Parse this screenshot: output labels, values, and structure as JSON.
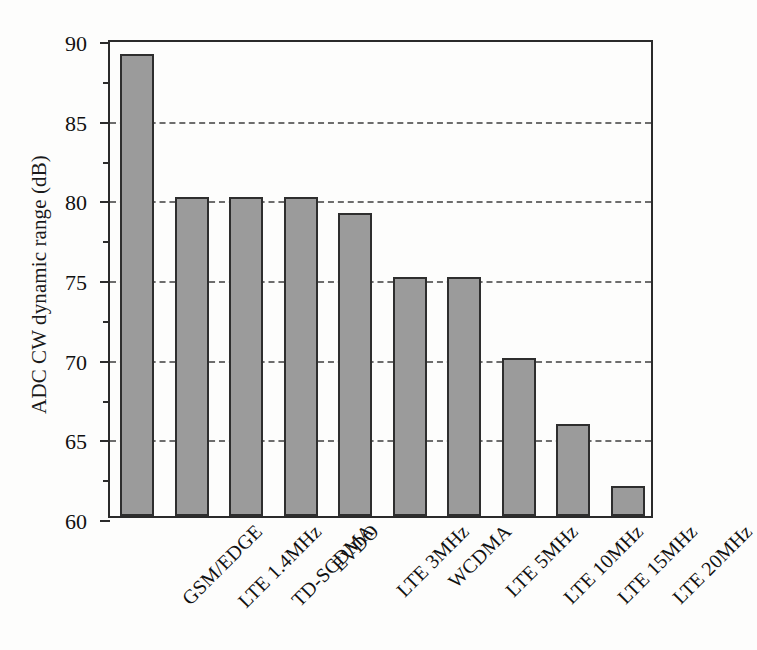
{
  "chart_data": {
    "type": "bar",
    "title": "",
    "subtitle": "",
    "xlabel": "",
    "ylabel": "ADC CW dynamic range (dB)",
    "categories": [
      "GSM/EDGE",
      "LTE 1.4MHz",
      "TD-SCDMA",
      "EVDO",
      "LTE 3MHz",
      "WCDMA",
      "LTE 5MHz",
      "LTE 10MHz",
      "LTE 15MHz",
      "LTE 20MHz"
    ],
    "values": [
      89,
      80,
      80,
      80,
      79,
      75,
      75,
      69.9,
      65.8,
      61.9
    ],
    "ylim": [
      60,
      90
    ],
    "y_major_ticks": [
      60,
      65,
      70,
      75,
      80,
      85,
      90
    ],
    "y_minor_ticks": [
      62.5,
      67.5,
      72.5,
      77.5,
      82.5,
      87.5
    ],
    "y_tick_labels": [
      "60",
      "65",
      "70",
      "75",
      "80",
      "85",
      "90"
    ],
    "gridlines": [
      65,
      70,
      75,
      80,
      85
    ],
    "grid": true,
    "grid_style": "dashed",
    "grid_axis": "y",
    "legend": null,
    "legend_position": "none",
    "xtick_rotation": -45,
    "bar_fill_color": "#9b9b9b",
    "bar_edge_color": "#2e2e2e",
    "axis_color": "#2b2b2b",
    "background_color": "#fdfdfc"
  }
}
